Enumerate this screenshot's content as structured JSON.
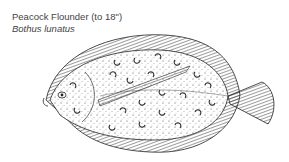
{
  "caption": {
    "common_name": "Peacock Flounder (to 18\")",
    "scientific_name": "Bothus lunatus"
  },
  "illustration": {
    "subject": "peacock flounder",
    "style": "black and white pen-and-ink drawing",
    "ink_color": "#1a1a1a",
    "background": "#ffffff"
  }
}
